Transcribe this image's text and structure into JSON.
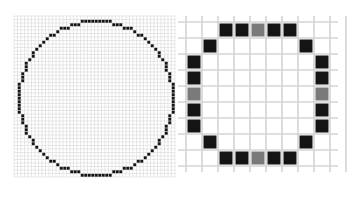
{
  "figure": {
    "colors": {
      "background": "#ffffff",
      "grid_line_fine": "#d9d9d9",
      "grid_line_coarse": "#d4d4d4",
      "filled_pixel": "#141414",
      "gray_pixel": "#7a7a7a"
    }
  },
  "left_panel": {
    "grid": {
      "x": 14,
      "y": 16,
      "cols": 46,
      "rows": 46,
      "cell": 3.5
    },
    "circle": {
      "cx": 23,
      "cy": 23,
      "r": 22
    }
  },
  "right_panel": {
    "grid": {
      "x": 186,
      "y": 22,
      "cols": 10,
      "rows": 10,
      "cell": 16
    },
    "pixels": [
      {
        "c": 2,
        "r": 0,
        "t": "b"
      },
      {
        "c": 3,
        "r": 0,
        "t": "b"
      },
      {
        "c": 4,
        "r": 0,
        "t": "g"
      },
      {
        "c": 5,
        "r": 0,
        "t": "b"
      },
      {
        "c": 6,
        "r": 0,
        "t": "b"
      },
      {
        "c": 1,
        "r": 1,
        "t": "b"
      },
      {
        "c": 7,
        "r": 1,
        "t": "b"
      },
      {
        "c": 0,
        "r": 2,
        "t": "b"
      },
      {
        "c": 8,
        "r": 2,
        "t": "b"
      },
      {
        "c": 0,
        "r": 3,
        "t": "b"
      },
      {
        "c": 8,
        "r": 3,
        "t": "b"
      },
      {
        "c": 0,
        "r": 4,
        "t": "g"
      },
      {
        "c": 8,
        "r": 4,
        "t": "g"
      },
      {
        "c": 0,
        "r": 5,
        "t": "b"
      },
      {
        "c": 8,
        "r": 5,
        "t": "b"
      },
      {
        "c": 0,
        "r": 6,
        "t": "b"
      },
      {
        "c": 8,
        "r": 6,
        "t": "b"
      },
      {
        "c": 1,
        "r": 7,
        "t": "b"
      },
      {
        "c": 7,
        "r": 7,
        "t": "b"
      },
      {
        "c": 2,
        "r": 8,
        "t": "b"
      },
      {
        "c": 3,
        "r": 8,
        "t": "b"
      },
      {
        "c": 4,
        "r": 8,
        "t": "g"
      },
      {
        "c": 5,
        "r": 8,
        "t": "b"
      },
      {
        "c": 6,
        "r": 8,
        "t": "b"
      }
    ]
  }
}
